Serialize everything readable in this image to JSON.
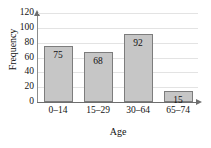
{
  "chart_data": {
    "type": "bar",
    "title": "",
    "categories": [
      "0–14",
      "15–29",
      "30–64",
      "65–74"
    ],
    "values": [
      75,
      68,
      92,
      15
    ],
    "xlabel": "Age",
    "ylabel": "Frequency",
    "ylim": [
      0,
      120
    ],
    "yticks": [
      0,
      20,
      40,
      60,
      80,
      100,
      120
    ],
    "grid": true,
    "legend": false,
    "data_labels": [
      "75",
      "68",
      "92",
      "15"
    ],
    "bar_color": "#c6c6c6",
    "bar_border_color": "#7d7d7d",
    "gridline_color": "#e3e3e3",
    "axis_color": "#6e6e6e"
  },
  "axes": {
    "y_title": "Frequency",
    "x_title": "Age",
    "y_tick_labels": [
      "120",
      "100",
      "80",
      "60",
      "40",
      "20",
      "0"
    ]
  }
}
